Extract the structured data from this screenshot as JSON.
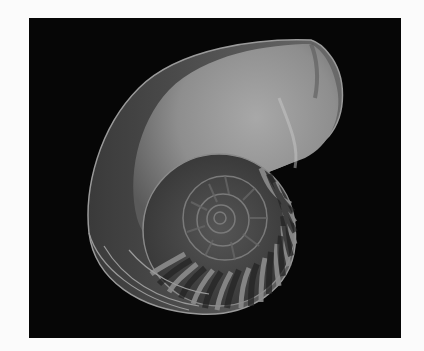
{
  "image": {
    "subject": "nautilus shell cross-section",
    "description": "Grayscale photograph of a halved chambered nautilus shell showing its logarithmic spiral and septa on a black background",
    "colors": {
      "page_background": "#fbfbfb",
      "photo_background": "#060606",
      "shell_body_light": "#9a9a9a",
      "shell_body_dark": "#4a4a4a",
      "chamber_dark": "#2a2a2a",
      "septa_light": "#8c8c8c"
    }
  }
}
